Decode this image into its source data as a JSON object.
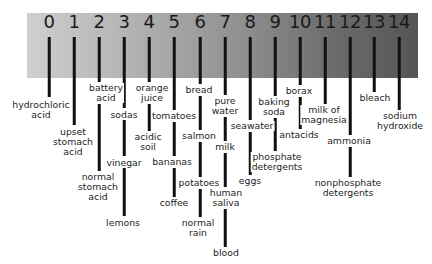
{
  "colors": {
    "bar_light": "#cfcfcf",
    "bar_dark": "#555555",
    "line": "#111111",
    "text": "#1e1e1e"
  },
  "scale": {
    "ticks": [
      {
        "value": "0",
        "x": 49
      },
      {
        "value": "1",
        "x": 74
      },
      {
        "value": "2",
        "x": 99
      },
      {
        "value": "3",
        "x": 124
      },
      {
        "value": "4",
        "x": 149
      },
      {
        "value": "5",
        "x": 174
      },
      {
        "value": "6",
        "x": 200
      },
      {
        "value": "7",
        "x": 225
      },
      {
        "value": "8",
        "x": 250
      },
      {
        "value": "9",
        "x": 275
      },
      {
        "value": "10",
        "x": 300
      },
      {
        "value": "11",
        "x": 325
      },
      {
        "value": "12",
        "x": 350
      },
      {
        "value": "13",
        "x": 374
      },
      {
        "value": "14",
        "x": 399
      }
    ]
  },
  "substances": [
    {
      "ph": 0,
      "label": "hydrochloric\nacid",
      "x": 41,
      "y": 100
    },
    {
      "ph": 1,
      "label": "upset\nstomach\nacid",
      "x": 73,
      "y": 127
    },
    {
      "ph": 2,
      "label": "battery\nacid",
      "x": 106,
      "y": 83
    },
    {
      "ph": 2,
      "label": "normal\nstomach\nacid",
      "x": 98,
      "y": 172
    },
    {
      "ph": 3,
      "label": "sodas",
      "x": 124,
      "y": 110
    },
    {
      "ph": 3,
      "label": "vinegar",
      "x": 124,
      "y": 158
    },
    {
      "ph": 3,
      "label": "lemons",
      "x": 123,
      "y": 218
    },
    {
      "ph": 4,
      "label": "orange\njuice",
      "x": 152,
      "y": 83
    },
    {
      "ph": 4,
      "label": "acidic\nsoil",
      "x": 148,
      "y": 132
    },
    {
      "ph": 5,
      "label": "tomatoes",
      "x": 174,
      "y": 111
    },
    {
      "ph": 5,
      "label": "bananas",
      "x": 172,
      "y": 157
    },
    {
      "ph": 5,
      "label": "coffee",
      "x": 174,
      "y": 198
    },
    {
      "ph": 6,
      "label": "bread",
      "x": 199,
      "y": 85
    },
    {
      "ph": 6,
      "label": "salmon",
      "x": 199,
      "y": 131
    },
    {
      "ph": 6,
      "label": "potatoes",
      "x": 199,
      "y": 178
    },
    {
      "ph": 6,
      "label": "normal\nrain",
      "x": 198,
      "y": 218
    },
    {
      "ph": 7,
      "label": "pure\nwater",
      "x": 225,
      "y": 96
    },
    {
      "ph": 7,
      "label": "milk",
      "x": 225,
      "y": 142
    },
    {
      "ph": 7,
      "label": "human\nsaliva",
      "x": 226,
      "y": 188
    },
    {
      "ph": 7,
      "label": "blood",
      "x": 226,
      "y": 248
    },
    {
      "ph": 8,
      "label": "seawater",
      "x": 252,
      "y": 121
    },
    {
      "ph": 8,
      "label": "eggs",
      "x": 250,
      "y": 176
    },
    {
      "ph": 9,
      "label": "baking\nsoda",
      "x": 274,
      "y": 97
    },
    {
      "ph": 9,
      "label": "phosphate\ndetergents",
      "x": 277,
      "y": 152
    },
    {
      "ph": 10,
      "label": "borax",
      "x": 299,
      "y": 86
    },
    {
      "ph": 10,
      "label": "antacids",
      "x": 299,
      "y": 130
    },
    {
      "ph": 11,
      "label": "milk of\nmagnesia",
      "x": 324,
      "y": 105
    },
    {
      "ph": 12,
      "label": "ammonia",
      "x": 349,
      "y": 136
    },
    {
      "ph": 12,
      "label": "nonphosphate\ndetergents",
      "x": 348,
      "y": 178
    },
    {
      "ph": 13,
      "label": "bleach",
      "x": 375,
      "y": 93
    },
    {
      "ph": 14,
      "label": "sodium\nhydroxide",
      "x": 400,
      "y": 111
    }
  ],
  "segments": [
    {
      "x": 49,
      "y1": 37,
      "y2": 97
    },
    {
      "x": 74,
      "y1": 37,
      "y2": 125
    },
    {
      "x": 99,
      "y1": 37,
      "y2": 82
    },
    {
      "x": 99,
      "y1": 104,
      "y2": 171
    },
    {
      "x": 124,
      "y1": 37,
      "y2": 108
    },
    {
      "x": 124,
      "y1": 120,
      "y2": 156
    },
    {
      "x": 124,
      "y1": 168,
      "y2": 216
    },
    {
      "x": 149,
      "y1": 37,
      "y2": 82
    },
    {
      "x": 149,
      "y1": 104,
      "y2": 131
    },
    {
      "x": 174,
      "y1": 37,
      "y2": 110
    },
    {
      "x": 174,
      "y1": 122,
      "y2": 156
    },
    {
      "x": 174,
      "y1": 168,
      "y2": 197
    },
    {
      "x": 200,
      "y1": 37,
      "y2": 84
    },
    {
      "x": 200,
      "y1": 96,
      "y2": 130
    },
    {
      "x": 200,
      "y1": 142,
      "y2": 177
    },
    {
      "x": 200,
      "y1": 189,
      "y2": 217
    },
    {
      "x": 225,
      "y1": 37,
      "y2": 95
    },
    {
      "x": 225,
      "y1": 117,
      "y2": 141
    },
    {
      "x": 225,
      "y1": 153,
      "y2": 187
    },
    {
      "x": 225,
      "y1": 209,
      "y2": 247
    },
    {
      "x": 250,
      "y1": 37,
      "y2": 120
    },
    {
      "x": 250,
      "y1": 132,
      "y2": 175
    },
    {
      "x": 275,
      "y1": 37,
      "y2": 96
    },
    {
      "x": 275,
      "y1": 118,
      "y2": 151
    },
    {
      "x": 300,
      "y1": 37,
      "y2": 85
    },
    {
      "x": 300,
      "y1": 97,
      "y2": 129
    },
    {
      "x": 325,
      "y1": 37,
      "y2": 104
    },
    {
      "x": 350,
      "y1": 37,
      "y2": 135
    },
    {
      "x": 350,
      "y1": 147,
      "y2": 177
    },
    {
      "x": 374,
      "y1": 37,
      "y2": 92
    },
    {
      "x": 399,
      "y1": 37,
      "y2": 110
    }
  ]
}
